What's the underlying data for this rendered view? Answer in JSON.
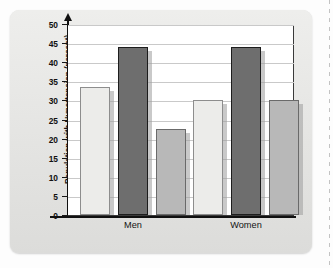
{
  "figure": {
    "panel_background": "#e7e7e5",
    "plot_background": "#ffffff"
  },
  "chart_data": {
    "type": "bar",
    "title": "",
    "subtitle": "",
    "xlabel": "",
    "ylabel": "Population with Hypertension (percent)",
    "categories": [
      "Men",
      "Women"
    ],
    "ylim": [
      0,
      50
    ],
    "ytick_step": 5,
    "ytick_labels": [
      "0",
      "5",
      "10",
      "15",
      "20",
      "25",
      "30",
      "35",
      "40",
      "45",
      "50"
    ],
    "ytick_values": [
      0,
      5,
      10,
      15,
      20,
      25,
      30,
      35,
      40,
      45,
      50
    ],
    "grid": true,
    "grid_axis": "y",
    "legend": false,
    "legend_position": "none",
    "series": [
      {
        "name": "series-1",
        "color": "#ececea",
        "values": [
          33.5,
          30.0
        ]
      },
      {
        "name": "series-2",
        "color": "#6e6e6e",
        "values": [
          44.0,
          44.0
        ]
      },
      {
        "name": "series-3",
        "color": "#b8b8b8",
        "values": [
          22.5,
          30.0
        ]
      }
    ],
    "bars": [
      {
        "group": "Men",
        "series": "series-1",
        "value": 33.5,
        "color": "#ececea",
        "edge": "#8d8d8d"
      },
      {
        "group": "Men",
        "series": "series-2",
        "value": 44.0,
        "color": "#6e6e6e",
        "edge": "#1d1d1d"
      },
      {
        "group": "Men",
        "series": "series-3",
        "value": 22.5,
        "color": "#b8b8b8",
        "edge": "#6a6a6a"
      },
      {
        "group": "Women",
        "series": "series-1",
        "value": 30.0,
        "color": "#ececea",
        "edge": "#8d8d8d"
      },
      {
        "group": "Women",
        "series": "series-2",
        "value": 44.0,
        "color": "#6e6e6e",
        "edge": "#1d1d1d"
      },
      {
        "group": "Women",
        "series": "series-3",
        "value": 30.0,
        "color": "#b8b8b8",
        "edge": "#6a6a6a"
      }
    ]
  }
}
